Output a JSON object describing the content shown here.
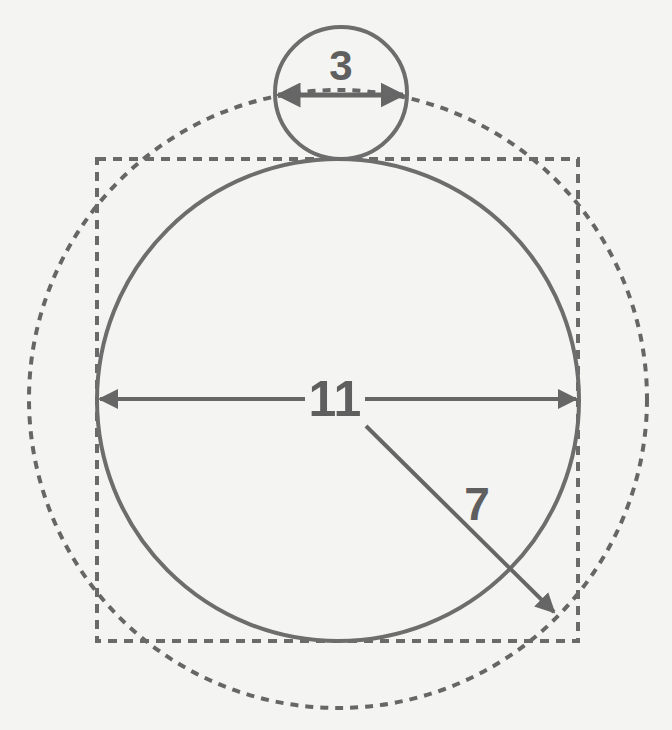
{
  "diagram": {
    "colors": {
      "stroke": "#6a6a6a",
      "background": "#f4f4f2",
      "text": "#5f5f5f"
    },
    "labels": {
      "small_circle_diameter": "3",
      "big_circle_diameter": "11",
      "outer_circle_radius": "7"
    },
    "shapes": {
      "square": {
        "x": 97,
        "y": 159,
        "size": 481,
        "style": "dashed"
      },
      "big_circle": {
        "cx": 338,
        "cy": 399,
        "r": 241,
        "style": "solid"
      },
      "outer_circle": {
        "cx": 338,
        "cy": 399,
        "r": 309,
        "style": "dashed"
      },
      "small_circle": {
        "cx": 341,
        "cy": 93,
        "r": 66,
        "style": "solid"
      }
    }
  }
}
